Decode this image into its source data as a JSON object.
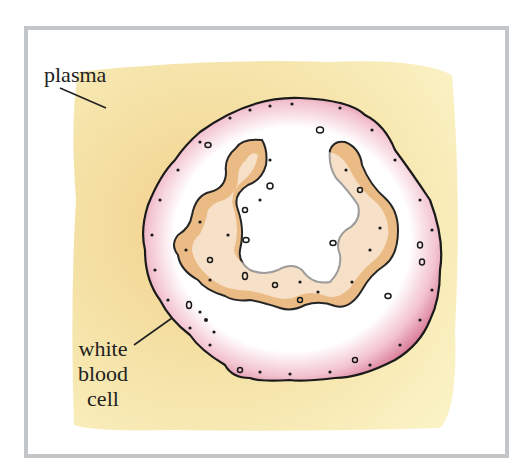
{
  "diagram": {
    "type": "labeled-illustration",
    "labels": {
      "plasma": "plasma",
      "wbc_line1": "white",
      "wbc_line2": "blood",
      "wbc_line3": "cell"
    },
    "colors": {
      "frame": "#c3c6c9",
      "plasma": "#f6e9b0",
      "plasma_shadow": "#e9c17a",
      "membrane": "#dc8fa6",
      "cytoplasm": "#ffffff",
      "nucleus": "#eab87f",
      "outline": "#1a1a1a"
    }
  }
}
